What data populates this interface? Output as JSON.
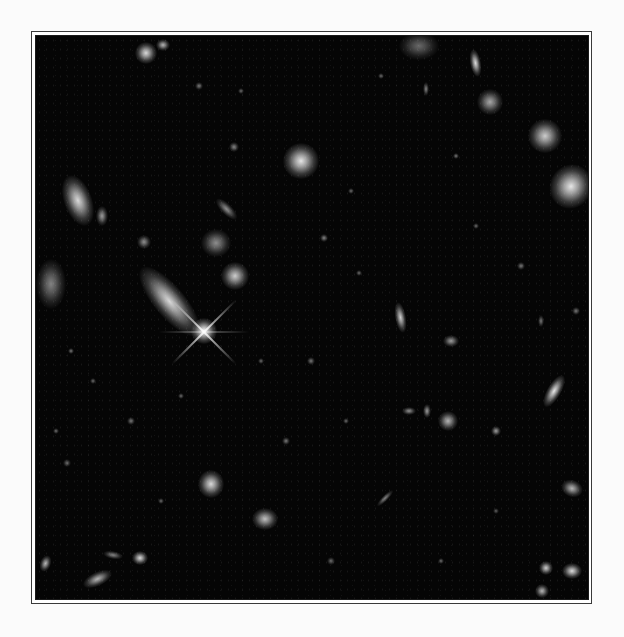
{
  "image": {
    "subject": "deep field of galaxies and stars",
    "background_color": "#050505",
    "frame_color": "#3a3a3a",
    "page_color": "#fbfbfb"
  },
  "objects": [
    {
      "x": 168,
      "y": 300,
      "w": 22,
      "h": 62,
      "rot": -40,
      "b": 0.85,
      "kind": "galaxy"
    },
    {
      "x": 203,
      "y": 330,
      "w": 16,
      "h": 16,
      "rot": 0,
      "b": 1.0,
      "kind": "star"
    },
    {
      "x": 77,
      "y": 200,
      "w": 20,
      "h": 38,
      "rot": -20,
      "b": 0.85,
      "kind": "galaxy"
    },
    {
      "x": 50,
      "y": 283,
      "w": 22,
      "h": 36,
      "rot": 0,
      "b": 0.5,
      "kind": "galaxy"
    },
    {
      "x": 300,
      "y": 160,
      "w": 26,
      "h": 26,
      "rot": 0,
      "b": 0.9,
      "kind": "galaxy"
    },
    {
      "x": 215,
      "y": 242,
      "w": 22,
      "h": 20,
      "rot": 0,
      "b": 0.55,
      "kind": "galaxy"
    },
    {
      "x": 234,
      "y": 275,
      "w": 20,
      "h": 20,
      "rot": 0,
      "b": 0.8,
      "kind": "galaxy"
    },
    {
      "x": 226,
      "y": 208,
      "w": 8,
      "h": 20,
      "rot": -45,
      "b": 0.55,
      "kind": "galaxy"
    },
    {
      "x": 544,
      "y": 135,
      "w": 24,
      "h": 24,
      "rot": 0,
      "b": 0.8,
      "kind": "galaxy"
    },
    {
      "x": 570,
      "y": 185,
      "w": 30,
      "h": 32,
      "rot": 30,
      "b": 0.9,
      "kind": "galaxy"
    },
    {
      "x": 475,
      "y": 62,
      "w": 8,
      "h": 20,
      "rot": -10,
      "b": 0.85,
      "kind": "galaxy"
    },
    {
      "x": 489,
      "y": 101,
      "w": 18,
      "h": 18,
      "rot": 0,
      "b": 0.65,
      "kind": "galaxy"
    },
    {
      "x": 418,
      "y": 45,
      "w": 28,
      "h": 20,
      "rot": 0,
      "b": 0.4,
      "kind": "galaxy"
    },
    {
      "x": 145,
      "y": 52,
      "w": 16,
      "h": 16,
      "rot": 0,
      "b": 0.85,
      "kind": "galaxy"
    },
    {
      "x": 162,
      "y": 44,
      "w": 10,
      "h": 8,
      "rot": 0,
      "b": 0.7,
      "kind": "galaxy"
    },
    {
      "x": 553,
      "y": 390,
      "w": 10,
      "h": 26,
      "rot": 30,
      "b": 0.9,
      "kind": "galaxy"
    },
    {
      "x": 400,
      "y": 316,
      "w": 8,
      "h": 22,
      "rot": -10,
      "b": 0.8,
      "kind": "galaxy"
    },
    {
      "x": 450,
      "y": 340,
      "w": 12,
      "h": 8,
      "rot": 0,
      "b": 0.6,
      "kind": "galaxy"
    },
    {
      "x": 447,
      "y": 420,
      "w": 14,
      "h": 14,
      "rot": 0,
      "b": 0.7,
      "kind": "galaxy"
    },
    {
      "x": 426,
      "y": 410,
      "w": 6,
      "h": 10,
      "rot": 0,
      "b": 0.6,
      "kind": "galaxy"
    },
    {
      "x": 408,
      "y": 410,
      "w": 10,
      "h": 6,
      "rot": 0,
      "b": 0.55,
      "kind": "galaxy"
    },
    {
      "x": 210,
      "y": 483,
      "w": 18,
      "h": 20,
      "rot": 0,
      "b": 0.85,
      "kind": "galaxy"
    },
    {
      "x": 264,
      "y": 518,
      "w": 18,
      "h": 16,
      "rot": 0,
      "b": 0.75,
      "kind": "galaxy"
    },
    {
      "x": 96,
      "y": 578,
      "w": 22,
      "h": 10,
      "rot": -25,
      "b": 0.7,
      "kind": "galaxy"
    },
    {
      "x": 139,
      "y": 557,
      "w": 12,
      "h": 10,
      "rot": 0,
      "b": 0.85,
      "kind": "galaxy"
    },
    {
      "x": 112,
      "y": 554,
      "w": 14,
      "h": 6,
      "rot": 10,
      "b": 0.5,
      "kind": "galaxy"
    },
    {
      "x": 45,
      "y": 562,
      "w": 8,
      "h": 12,
      "rot": 20,
      "b": 0.7,
      "kind": "galaxy"
    },
    {
      "x": 571,
      "y": 487,
      "w": 16,
      "h": 12,
      "rot": 20,
      "b": 0.7,
      "kind": "galaxy"
    },
    {
      "x": 545,
      "y": 567,
      "w": 10,
      "h": 10,
      "rot": 0,
      "b": 0.8,
      "kind": "galaxy"
    },
    {
      "x": 571,
      "y": 570,
      "w": 14,
      "h": 12,
      "rot": 0,
      "b": 0.85,
      "kind": "galaxy"
    },
    {
      "x": 541,
      "y": 590,
      "w": 10,
      "h": 10,
      "rot": 0,
      "b": 0.7,
      "kind": "galaxy"
    },
    {
      "x": 384,
      "y": 497,
      "w": 4,
      "h": 16,
      "rot": 45,
      "b": 0.5,
      "kind": "galaxy"
    },
    {
      "x": 101,
      "y": 215,
      "w": 8,
      "h": 14,
      "rot": 0,
      "b": 0.6,
      "kind": "galaxy"
    },
    {
      "x": 143,
      "y": 241,
      "w": 10,
      "h": 10,
      "rot": 0,
      "b": 0.55,
      "kind": "galaxy"
    },
    {
      "x": 233,
      "y": 146,
      "w": 6,
      "h": 6,
      "rot": 0,
      "b": 0.5,
      "kind": "star"
    },
    {
      "x": 323,
      "y": 237,
      "w": 5,
      "h": 5,
      "rot": 0,
      "b": 0.5,
      "kind": "star"
    },
    {
      "x": 358,
      "y": 272,
      "w": 4,
      "h": 4,
      "rot": 0,
      "b": 0.4,
      "kind": "star"
    },
    {
      "x": 310,
      "y": 360,
      "w": 5,
      "h": 5,
      "rot": 0,
      "b": 0.45,
      "kind": "star"
    },
    {
      "x": 345,
      "y": 420,
      "w": 4,
      "h": 4,
      "rot": 0,
      "b": 0.4,
      "kind": "star"
    },
    {
      "x": 495,
      "y": 430,
      "w": 6,
      "h": 6,
      "rot": 0,
      "b": 0.6,
      "kind": "star"
    },
    {
      "x": 130,
      "y": 420,
      "w": 5,
      "h": 5,
      "rot": 0,
      "b": 0.45,
      "kind": "star"
    },
    {
      "x": 92,
      "y": 380,
      "w": 4,
      "h": 4,
      "rot": 0,
      "b": 0.4,
      "kind": "star"
    },
    {
      "x": 66,
      "y": 462,
      "w": 5,
      "h": 5,
      "rot": 0,
      "b": 0.4,
      "kind": "star"
    },
    {
      "x": 70,
      "y": 350,
      "w": 4,
      "h": 4,
      "rot": 0,
      "b": 0.45,
      "kind": "star"
    },
    {
      "x": 455,
      "y": 155,
      "w": 4,
      "h": 4,
      "rot": 0,
      "b": 0.45,
      "kind": "star"
    },
    {
      "x": 520,
      "y": 265,
      "w": 5,
      "h": 5,
      "rot": 0,
      "b": 0.45,
      "kind": "star"
    },
    {
      "x": 475,
      "y": 225,
      "w": 4,
      "h": 4,
      "rot": 0,
      "b": 0.4,
      "kind": "star"
    },
    {
      "x": 380,
      "y": 75,
      "w": 4,
      "h": 4,
      "rot": 0,
      "b": 0.4,
      "kind": "star"
    },
    {
      "x": 240,
      "y": 90,
      "w": 4,
      "h": 4,
      "rot": 0,
      "b": 0.4,
      "kind": "star"
    },
    {
      "x": 198,
      "y": 85,
      "w": 5,
      "h": 5,
      "rot": 0,
      "b": 0.45,
      "kind": "star"
    },
    {
      "x": 425,
      "y": 88,
      "w": 4,
      "h": 10,
      "rot": 0,
      "b": 0.5,
      "kind": "galaxy"
    },
    {
      "x": 350,
      "y": 190,
      "w": 4,
      "h": 4,
      "rot": 0,
      "b": 0.4,
      "kind": "star"
    },
    {
      "x": 285,
      "y": 440,
      "w": 5,
      "h": 5,
      "rot": 0,
      "b": 0.45,
      "kind": "star"
    },
    {
      "x": 160,
      "y": 500,
      "w": 4,
      "h": 4,
      "rot": 0,
      "b": 0.4,
      "kind": "star"
    },
    {
      "x": 330,
      "y": 560,
      "w": 5,
      "h": 5,
      "rot": 0,
      "b": 0.4,
      "kind": "star"
    },
    {
      "x": 440,
      "y": 560,
      "w": 4,
      "h": 4,
      "rot": 0,
      "b": 0.4,
      "kind": "star"
    },
    {
      "x": 575,
      "y": 310,
      "w": 5,
      "h": 5,
      "rot": 0,
      "b": 0.45,
      "kind": "star"
    },
    {
      "x": 540,
      "y": 320,
      "w": 4,
      "h": 8,
      "rot": 0,
      "b": 0.45,
      "kind": "galaxy"
    },
    {
      "x": 180,
      "y": 395,
      "w": 4,
      "h": 4,
      "rot": 0,
      "b": 0.4,
      "kind": "star"
    },
    {
      "x": 260,
      "y": 360,
      "w": 4,
      "h": 4,
      "rot": 0,
      "b": 0.4,
      "kind": "star"
    },
    {
      "x": 55,
      "y": 430,
      "w": 4,
      "h": 4,
      "rot": 0,
      "b": 0.4,
      "kind": "star"
    },
    {
      "x": 495,
      "y": 510,
      "w": 4,
      "h": 4,
      "rot": 0,
      "b": 0.35,
      "kind": "star"
    }
  ],
  "diffraction_spikes": {
    "x": 203,
    "y": 330,
    "length": 90,
    "angles": [
      45,
      -45,
      0
    ]
  }
}
